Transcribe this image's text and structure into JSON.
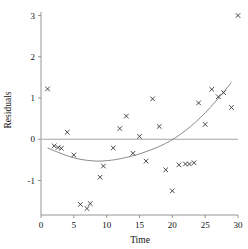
{
  "chart_data": {
    "type": "scatter",
    "title": "",
    "xlabel": "Time",
    "ylabel": "Residuals",
    "xlim": [
      0,
      30
    ],
    "ylim": [
      -1.8,
      3.2
    ],
    "xticks": [
      0,
      5,
      10,
      15,
      20,
      25,
      30
    ],
    "yticks": [
      -1,
      0,
      1,
      2,
      3
    ],
    "xtick_labels": [
      "0",
      "5",
      "10",
      "15",
      "20",
      "25",
      "30"
    ],
    "ytick_labels": [
      "-1",
      "0",
      "1",
      "2",
      "3"
    ],
    "grid": false,
    "legend": null,
    "marker": "x",
    "reference_lines": [
      {
        "name": "zero-line",
        "orientation": "horizontal",
        "value": 0
      }
    ],
    "series": [
      {
        "name": "Residuals",
        "marker": "x",
        "points": [
          {
            "x": 1,
            "y": 1.22
          },
          {
            "x": 2,
            "y": -0.16
          },
          {
            "x": 2.6,
            "y": -0.2
          },
          {
            "x": 3.1,
            "y": -0.22
          },
          {
            "x": 4,
            "y": 0.17
          },
          {
            "x": 5,
            "y": -0.38
          },
          {
            "x": 6,
            "y": -1.58
          },
          {
            "x": 7,
            "y": -1.68
          },
          {
            "x": 7.5,
            "y": -1.56
          },
          {
            "x": 9,
            "y": -0.92
          },
          {
            "x": 9.5,
            "y": -0.65
          },
          {
            "x": 11,
            "y": -0.21
          },
          {
            "x": 12,
            "y": 0.26
          },
          {
            "x": 13,
            "y": 0.56
          },
          {
            "x": 14,
            "y": -0.34
          },
          {
            "x": 15,
            "y": 0.07
          },
          {
            "x": 16,
            "y": -0.53
          },
          {
            "x": 17,
            "y": 0.98
          },
          {
            "x": 18,
            "y": 0.31
          },
          {
            "x": 19,
            "y": -0.74
          },
          {
            "x": 20,
            "y": -1.25
          },
          {
            "x": 21,
            "y": -0.62
          },
          {
            "x": 22,
            "y": -0.6
          },
          {
            "x": 22.6,
            "y": -0.6
          },
          {
            "x": 23.3,
            "y": -0.57
          },
          {
            "x": 24,
            "y": 0.88
          },
          {
            "x": 25,
            "y": 0.36
          },
          {
            "x": 26,
            "y": 1.21
          },
          {
            "x": 27,
            "y": 1.03
          },
          {
            "x": 27.8,
            "y": 1.13
          },
          {
            "x": 29,
            "y": 0.77
          },
          {
            "x": 30,
            "y": 3.0
          }
        ]
      }
    ],
    "fit_curve": {
      "name": "loess-quadratic-fit",
      "description": "smooth quadratic trend line",
      "points": [
        {
          "x": 1.0,
          "y": -0.21
        },
        {
          "x": 2.5,
          "y": -0.31
        },
        {
          "x": 4.0,
          "y": -0.4
        },
        {
          "x": 5.5,
          "y": -0.47
        },
        {
          "x": 7.0,
          "y": -0.51
        },
        {
          "x": 8.5,
          "y": -0.53
        },
        {
          "x": 10.0,
          "y": -0.52
        },
        {
          "x": 11.5,
          "y": -0.49
        },
        {
          "x": 13.0,
          "y": -0.44
        },
        {
          "x": 14.5,
          "y": -0.38
        },
        {
          "x": 16.0,
          "y": -0.3
        },
        {
          "x": 17.5,
          "y": -0.21
        },
        {
          "x": 19.0,
          "y": -0.1
        },
        {
          "x": 20.5,
          "y": 0.04
        },
        {
          "x": 22.0,
          "y": 0.21
        },
        {
          "x": 23.5,
          "y": 0.41
        },
        {
          "x": 25.0,
          "y": 0.64
        },
        {
          "x": 26.5,
          "y": 0.9
        },
        {
          "x": 28.0,
          "y": 1.18
        },
        {
          "x": 29.0,
          "y": 1.38
        }
      ]
    }
  }
}
